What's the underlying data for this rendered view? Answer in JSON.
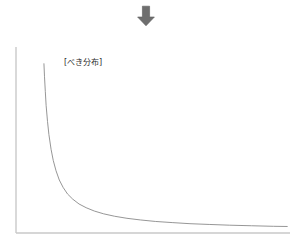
{
  "figure": {
    "background_color": "#ffffff",
    "annotation_arrow": {
      "icon": "arrow-down-icon",
      "direction": "down",
      "color": "#6e6e6e"
    }
  },
  "chart_data": {
    "type": "line",
    "title": "",
    "subtitle": "",
    "xlabel": "",
    "ylabel": "",
    "grid": false,
    "legend": null,
    "legend_position": "none",
    "axis_color": "#c9c9c9",
    "line_color": "#8a8a8a",
    "xlim": [
      0,
      100
    ],
    "ylim": [
      0,
      100
    ],
    "x_tick_labels": [],
    "y_tick_labels": [],
    "annotations": [
      {
        "name": "power-law-label",
        "text": "[べき分布]",
        "x": 18,
        "y": 92,
        "color": "#2b2b2b"
      }
    ],
    "series": [
      {
        "name": "べき分布",
        "description": "power-law decay curve",
        "x": [
          10.2,
          10.4,
          10.7,
          11.0,
          11.5,
          12.0,
          12.8,
          13.6,
          14.6,
          15.8,
          17.2,
          18.8,
          20.7,
          23.0,
          25.6,
          28.6,
          32.0,
          36.0,
          40.5,
          45.5,
          51.0,
          57.0,
          63.5,
          70.5,
          78.0,
          86.0,
          94.0,
          99.0
        ],
        "y": [
          91.0,
          84.0,
          76.0,
          68.5,
          60.0,
          53.0,
          45.0,
          39.0,
          33.5,
          28.5,
          24.5,
          21.0,
          18.2,
          15.6,
          13.6,
          11.8,
          10.3,
          9.0,
          7.9,
          7.0,
          6.2,
          5.6,
          5.0,
          4.6,
          4.2,
          3.9,
          3.6,
          3.5
        ]
      }
    ]
  }
}
